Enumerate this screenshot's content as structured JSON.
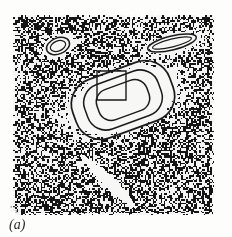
{
  "figure": {
    "panel_label": "(a)",
    "scan_artifact_marks": "˚˚ₓ",
    "bleed_through_top": "         ",
    "bleed_through_bottom": "      ",
    "panel": {
      "x": 13,
      "y": 15,
      "width": 201,
      "height": 200,
      "background_mean_gray": "#8a8a8a",
      "noise_type": "salt-and-pepper speckle",
      "noise_black": "#151515",
      "noise_white": "#f4f4f4",
      "noise_grain_px": 1.6,
      "noise_black_fraction": 0.5
    },
    "contour_color": "#1a1a1a",
    "halo_color": "#f7f7f5",
    "features": [
      {
        "name": "small-ellipse-upper-left",
        "kind": "ellipse-contour",
        "cx": 45,
        "cy": 31,
        "rx": 12,
        "ry": 8,
        "rotation_deg": -22,
        "halo_rx": 25,
        "halo_ry": 14,
        "inner_rx": 8,
        "inner_ry": 5
      },
      {
        "name": "elongated-ellipse-upper-right",
        "kind": "ellipse-contour",
        "cx": 159,
        "cy": 28,
        "rx": 25,
        "ry": 7,
        "rotation_deg": -14,
        "halo_rx": 36,
        "halo_ry": 14,
        "inner_rx": 20,
        "inner_ry": 4
      },
      {
        "name": "central-nested-contours",
        "kind": "nested-rounded-rect-contours",
        "cx": 110,
        "cy": 85,
        "rotation_deg": -20,
        "halo_rx": 73,
        "halo_ry": 38,
        "rings": [
          {
            "w": 103,
            "h": 62,
            "r": 26
          },
          {
            "w": 78,
            "h": 47,
            "r": 19
          },
          {
            "w": 53,
            "h": 32,
            "r": 13
          }
        ]
      },
      {
        "name": "roi-square-box",
        "kind": "open-square-outline",
        "x": 84,
        "y": 56,
        "width": 29,
        "height": 29,
        "stroke_width": 1.4
      },
      {
        "name": "diagonal-bright-streak",
        "kind": "tapered-streak",
        "x1": 68,
        "y1": 140,
        "x2": 122,
        "y2": 192,
        "max_width": 13
      }
    ]
  }
}
